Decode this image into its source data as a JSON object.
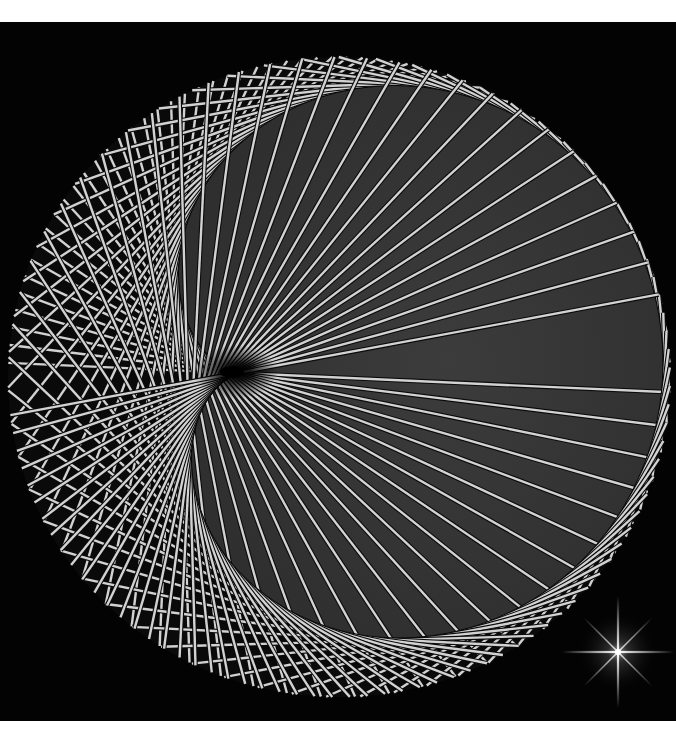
{
  "artwork": {
    "title": "",
    "kind": "string-art-cardioid",
    "canvas": {
      "page_background": "#ffffff",
      "panel_top": 22,
      "panel_height": 699,
      "panel_width": 676,
      "panel_background": "#030303"
    },
    "circle": {
      "cx": 339,
      "cy": 355,
      "rx": 331,
      "ry": 320,
      "lattice_background": "#0a0a0a"
    },
    "envelope": {
      "cusp_x": 237,
      "cusp_y": 351,
      "scale": 214,
      "rotation_deg": -4,
      "fill_outer": "#2e2e2e",
      "fill_inner": "#3c3c3c"
    },
    "strings": {
      "count": 118,
      "color": "#d2d2d2",
      "width": 2.4,
      "outline_color": "#0b0b0b",
      "outline_width": 4.6
    },
    "eye": {
      "x": 236,
      "y": 350,
      "radius": 34,
      "color": "#000000"
    },
    "sparkle": {
      "x": 618,
      "y": 630,
      "long_ray": 56,
      "short_ray": 34,
      "glow_radius": 40,
      "color": "#ffffff"
    }
  }
}
